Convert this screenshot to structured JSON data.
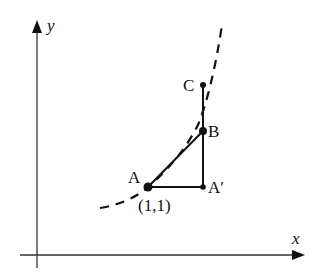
{
  "diagram": {
    "axes": {
      "x_label": "x",
      "y_label": "y"
    },
    "points": [
      {
        "name": "A",
        "label": "A",
        "coord_label": "(1,1)"
      },
      {
        "name": "A_prime",
        "label": "A′"
      },
      {
        "name": "B",
        "label": "B"
      },
      {
        "name": "C",
        "label": "C"
      }
    ],
    "segments": [
      "A-A′",
      "A′-C",
      "A-B"
    ],
    "curve": {
      "style": "dashed",
      "passes_through": [
        "A",
        "B"
      ]
    },
    "colors": {
      "stroke": "#111111",
      "background": "#ffffff"
    }
  }
}
